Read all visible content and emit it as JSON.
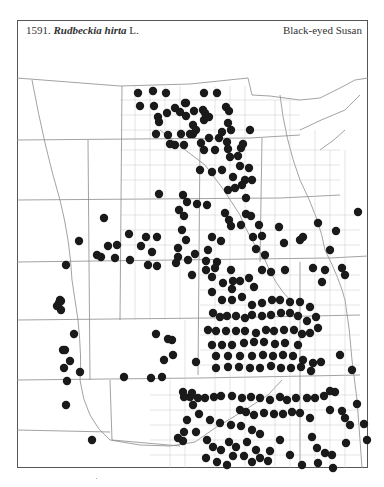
{
  "header": {
    "number": "1591.",
    "genus_species": "Rudbeckia hirta",
    "author": "L.",
    "common_name": "Black-eyed Susan"
  },
  "map": {
    "dot_color": "#1a1a1a",
    "line_color": "#8a8a8a",
    "dot_radius": 4.2,
    "dots": [
      [
        138,
        93
      ],
      [
        153,
        91
      ],
      [
        166,
        93
      ],
      [
        140,
        106
      ],
      [
        154,
        106
      ],
      [
        175,
        108
      ],
      [
        186,
        103
      ],
      [
        194,
        111
      ],
      [
        204,
        93
      ],
      [
        217,
        93
      ],
      [
        159,
        122
      ],
      [
        158,
        117
      ],
      [
        167,
        113
      ],
      [
        180,
        112
      ],
      [
        185,
        103
      ],
      [
        203,
        110
      ],
      [
        226,
        107
      ],
      [
        229,
        111
      ],
      [
        186,
        116
      ],
      [
        205,
        113
      ],
      [
        190,
        134
      ],
      [
        193,
        125
      ],
      [
        204,
        120
      ],
      [
        209,
        117
      ],
      [
        228,
        123
      ],
      [
        231,
        130
      ],
      [
        222,
        132
      ],
      [
        196,
        130
      ],
      [
        209,
        138
      ],
      [
        219,
        138
      ],
      [
        156,
        134
      ],
      [
        168,
        135
      ],
      [
        181,
        134
      ],
      [
        193,
        134
      ],
      [
        170,
        144
      ],
      [
        175,
        145
      ],
      [
        184,
        145
      ],
      [
        201,
        143
      ],
      [
        204,
        150
      ],
      [
        215,
        150
      ],
      [
        227,
        142
      ],
      [
        228,
        149
      ],
      [
        230,
        157
      ],
      [
        238,
        156
      ],
      [
        241,
        148
      ],
      [
        243,
        144
      ],
      [
        250,
        130
      ],
      [
        240,
        166
      ],
      [
        249,
        168
      ],
      [
        222,
        170
      ],
      [
        212,
        172
      ],
      [
        233,
        177
      ],
      [
        235,
        188
      ],
      [
        242,
        185
      ],
      [
        245,
        180
      ],
      [
        246,
        198
      ],
      [
        183,
        195
      ],
      [
        187,
        202
      ],
      [
        197,
        204
      ],
      [
        207,
        205
      ],
      [
        200,
        170
      ],
      [
        228,
        190
      ],
      [
        252,
        180
      ],
      [
        246,
        214
      ],
      [
        225,
        213
      ],
      [
        229,
        220
      ],
      [
        259,
        225
      ],
      [
        241,
        225
      ],
      [
        253,
        237
      ],
      [
        221,
        241
      ],
      [
        256,
        249
      ],
      [
        265,
        255
      ],
      [
        279,
        227
      ],
      [
        284,
        243
      ],
      [
        262,
        236
      ],
      [
        303,
        237
      ],
      [
        300,
        240
      ],
      [
        336,
        231
      ],
      [
        251,
        216
      ],
      [
        262,
        270
      ],
      [
        318,
        223
      ],
      [
        325,
        270
      ],
      [
        358,
        212
      ],
      [
        330,
        250
      ],
      [
        342,
        268
      ],
      [
        345,
        275
      ],
      [
        313,
        268
      ],
      [
        322,
        282
      ],
      [
        285,
        270
      ],
      [
        271,
        272
      ],
      [
        159,
        194
      ],
      [
        179,
        210
      ],
      [
        184,
        216
      ],
      [
        182,
        230
      ],
      [
        186,
        240
      ],
      [
        178,
        257
      ],
      [
        176,
        263
      ],
      [
        188,
        260
      ],
      [
        195,
        254
      ],
      [
        192,
        275
      ],
      [
        206,
        270
      ],
      [
        152,
        252
      ],
      [
        178,
        248
      ],
      [
        231,
        226
      ],
      [
        212,
        237
      ],
      [
        208,
        250
      ],
      [
        206,
        261
      ],
      [
        217,
        262
      ],
      [
        157,
        266
      ],
      [
        130,
        260
      ],
      [
        104,
        218
      ],
      [
        129,
        234
      ],
      [
        146,
        237
      ],
      [
        157,
        237
      ],
      [
        79,
        241
      ],
      [
        115,
        258
      ],
      [
        108,
        246
      ],
      [
        117,
        245
      ],
      [
        141,
        246
      ],
      [
        148,
        265
      ],
      [
        66,
        265
      ],
      [
        97,
        255
      ],
      [
        101,
        257
      ],
      [
        60,
        300
      ],
      [
        61,
        301
      ],
      [
        59,
        303
      ],
      [
        57,
        306
      ],
      [
        61,
        310
      ],
      [
        74,
        334
      ],
      [
        65,
        350
      ],
      [
        63,
        350
      ],
      [
        70,
        361
      ],
      [
        64,
        368
      ],
      [
        80,
        372
      ],
      [
        67,
        381
      ],
      [
        66,
        405
      ],
      [
        92,
        440
      ],
      [
        124,
        377
      ],
      [
        151,
        378
      ],
      [
        162,
        377
      ],
      [
        173,
        355
      ],
      [
        164,
        360
      ],
      [
        156,
        334
      ],
      [
        168,
        339
      ],
      [
        172,
        340
      ],
      [
        196,
        362
      ],
      [
        183,
        392
      ],
      [
        215,
        268
      ],
      [
        231,
        270
      ],
      [
        212,
        277
      ],
      [
        223,
        283
      ],
      [
        233,
        281
      ],
      [
        240,
        281
      ],
      [
        249,
        278
      ],
      [
        254,
        287
      ],
      [
        232,
        289
      ],
      [
        212,
        292
      ],
      [
        222,
        300
      ],
      [
        232,
        300
      ],
      [
        242,
        297
      ],
      [
        252,
        305
      ],
      [
        262,
        303
      ],
      [
        213,
        313
      ],
      [
        220,
        317
      ],
      [
        227,
        316
      ],
      [
        236,
        316
      ],
      [
        245,
        318
      ],
      [
        252,
        315
      ],
      [
        262,
        316
      ],
      [
        271,
        315
      ],
      [
        281,
        313
      ],
      [
        290,
        313
      ],
      [
        298,
        316
      ],
      [
        307,
        321
      ],
      [
        316,
        317
      ],
      [
        310,
        307
      ],
      [
        300,
        302
      ],
      [
        290,
        302
      ],
      [
        280,
        300
      ],
      [
        272,
        300
      ],
      [
        208,
        330
      ],
      [
        216,
        331
      ],
      [
        226,
        331
      ],
      [
        236,
        331
      ],
      [
        245,
        331
      ],
      [
        256,
        333
      ],
      [
        266,
        330
      ],
      [
        274,
        331
      ],
      [
        284,
        330
      ],
      [
        294,
        330
      ],
      [
        302,
        334
      ],
      [
        310,
        333
      ],
      [
        318,
        328
      ],
      [
        298,
        345
      ],
      [
        285,
        343
      ],
      [
        275,
        344
      ],
      [
        264,
        342
      ],
      [
        254,
        342
      ],
      [
        244,
        343
      ],
      [
        232,
        345
      ],
      [
        222,
        345
      ],
      [
        212,
        345
      ],
      [
        216,
        356
      ],
      [
        228,
        356
      ],
      [
        240,
        356
      ],
      [
        252,
        356
      ],
      [
        263,
        355
      ],
      [
        273,
        356
      ],
      [
        283,
        355
      ],
      [
        293,
        356
      ],
      [
        303,
        360
      ],
      [
        313,
        363
      ],
      [
        216,
        368
      ],
      [
        228,
        367
      ],
      [
        239,
        367
      ],
      [
        250,
        368
      ],
      [
        260,
        368
      ],
      [
        271,
        366
      ],
      [
        281,
        368
      ],
      [
        291,
        368
      ],
      [
        301,
        367
      ],
      [
        311,
        371
      ],
      [
        321,
        362
      ],
      [
        340,
        355
      ],
      [
        352,
        370
      ],
      [
        330,
        391
      ],
      [
        324,
        396
      ],
      [
        315,
        398
      ],
      [
        307,
        398
      ],
      [
        296,
        398
      ],
      [
        287,
        400
      ],
      [
        280,
        397
      ],
      [
        270,
        400
      ],
      [
        260,
        398
      ],
      [
        251,
        397
      ],
      [
        242,
        398
      ],
      [
        232,
        396
      ],
      [
        221,
        396
      ],
      [
        214,
        397
      ],
      [
        205,
        398
      ],
      [
        198,
        398
      ],
      [
        190,
        397
      ],
      [
        184,
        397
      ],
      [
        240,
        410
      ],
      [
        246,
        412
      ],
      [
        254,
        415
      ],
      [
        264,
        413
      ],
      [
        274,
        414
      ],
      [
        283,
        414
      ],
      [
        292,
        412
      ],
      [
        300,
        413
      ],
      [
        310,
        418
      ],
      [
        330,
        410
      ],
      [
        342,
        411
      ],
      [
        357,
        404
      ],
      [
        350,
        425
      ],
      [
        345,
        418
      ],
      [
        312,
        437
      ],
      [
        317,
        448
      ],
      [
        325,
        453
      ],
      [
        332,
        455
      ],
      [
        346,
        443
      ],
      [
        364,
        424
      ],
      [
        367,
        440
      ],
      [
        335,
        392
      ],
      [
        192,
        393
      ],
      [
        193,
        405
      ],
      [
        199,
        414
      ],
      [
        210,
        420
      ],
      [
        220,
        423
      ],
      [
        231,
        425
      ],
      [
        241,
        426
      ],
      [
        252,
        430
      ],
      [
        260,
        434
      ],
      [
        229,
        442
      ],
      [
        236,
        447
      ],
      [
        247,
        442
      ],
      [
        256,
        450
      ],
      [
        270,
        451
      ],
      [
        280,
        440
      ],
      [
        187,
        420
      ],
      [
        184,
        432
      ],
      [
        183,
        441
      ],
      [
        196,
        432
      ],
      [
        178,
        438
      ],
      [
        207,
        440
      ],
      [
        213,
        447
      ],
      [
        221,
        450
      ],
      [
        233,
        456
      ],
      [
        244,
        456
      ],
      [
        260,
        458
      ],
      [
        206,
        458
      ],
      [
        217,
        462
      ],
      [
        227,
        465
      ],
      [
        252,
        462
      ],
      [
        268,
        461
      ],
      [
        333,
        468
      ],
      [
        302,
        465
      ],
      [
        318,
        463
      ],
      [
        290,
        455
      ]
    ]
  }
}
